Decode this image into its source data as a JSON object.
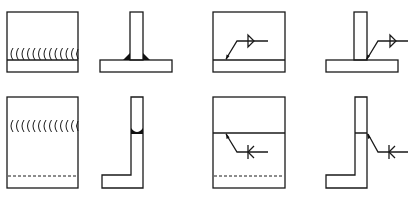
{
  "diagram": {
    "colors": {
      "line": "#1a1a1a",
      "background": "#ffffff"
    },
    "panels": [
      {
        "id": "top-left-plan",
        "type": "plan-view",
        "weld_marks": "arcs",
        "count_arcs": 12
      },
      {
        "id": "top-left-section",
        "type": "t-joint-section",
        "hatched": true,
        "fillet_fill": true
      },
      {
        "id": "top-right-plan",
        "type": "plan-view",
        "symbol": "fillet-triangle",
        "leader": true
      },
      {
        "id": "top-right-section",
        "type": "t-joint-section",
        "hatched": true,
        "symbol": "fillet-triangle",
        "leader": true
      },
      {
        "id": "bottom-left-plan",
        "type": "plan-view",
        "weld_marks": "arcs",
        "hidden_line": true
      },
      {
        "id": "bottom-left-section",
        "type": "l-joint-section",
        "butt_weld_fill": true
      },
      {
        "id": "bottom-right-plan",
        "type": "plan-view",
        "symbol": "k-groove",
        "hidden_line": true,
        "leader": true
      },
      {
        "id": "bottom-right-section",
        "type": "l-joint-section",
        "symbol": "k-groove",
        "leader": true
      }
    ]
  }
}
